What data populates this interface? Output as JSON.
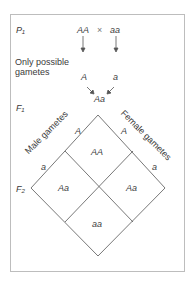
{
  "generations": {
    "p1": "P₁",
    "f1": "F₁",
    "f2": "F₂"
  },
  "parents": {
    "left": "AA",
    "cross": "×",
    "right": "aa"
  },
  "gametes_label": {
    "line1": "Only possible",
    "line2": "gametes"
  },
  "parent_gametes": {
    "left": "A",
    "right": "a"
  },
  "f1_offspring": "Aa",
  "punnett": {
    "male_label": "Male gametes",
    "female_label": "Female gametes",
    "male_gametes": [
      "A",
      "a"
    ],
    "female_gametes": [
      "A",
      "a"
    ],
    "cells": {
      "top": "AA",
      "left": "Aa",
      "right": "Aa",
      "bottom": "aa"
    }
  },
  "colors": {
    "line": "#555555",
    "border": "#bdbdbd",
    "text": "#3a3a3a"
  }
}
